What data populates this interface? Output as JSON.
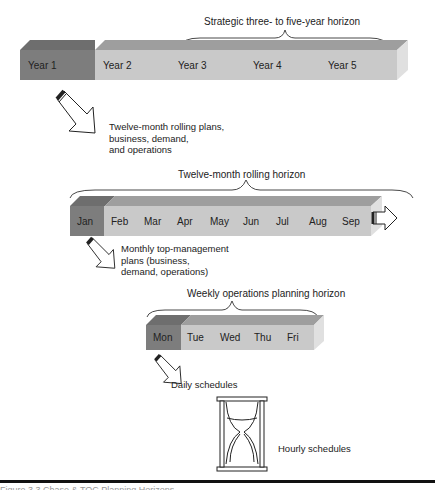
{
  "row_years": {
    "horizon_label": "Strategic three- to five-year horizon",
    "cells": [
      "Year 1",
      "Year 2",
      "Year 3",
      "Year 4",
      "Year 5"
    ],
    "highlighted_index": 0
  },
  "arrow1_text": [
    "Twelve-month rolling plans,",
    "business, demand,",
    "and operations"
  ],
  "row_months": {
    "horizon_label": "Twelve-month rolling horizon",
    "cells": [
      "Jan",
      "Feb",
      "Mar",
      "Apr",
      "May",
      "Jun",
      "Jul",
      "Aug",
      "Sep"
    ],
    "highlighted_index": 0
  },
  "arrow2_text": [
    "Monthly top-management",
    "plans (business,",
    "demand, operations)"
  ],
  "row_days": {
    "horizon_label": "Weekly operations planning horizon",
    "cells": [
      "Mon",
      "Tue",
      "Wed",
      "Thu",
      "Fri"
    ],
    "highlighted_index": 0
  },
  "arrow3_text": "Daily schedules",
  "hourglass_text": "Hourly schedules",
  "caption": "Figure 3.3   Chase & TOC Planning Horizons",
  "icons": {
    "down_right_arrow": "hollow-block-arrow",
    "right_arrow": "hollow-right-arrow",
    "hourglass": "hourglass"
  }
}
